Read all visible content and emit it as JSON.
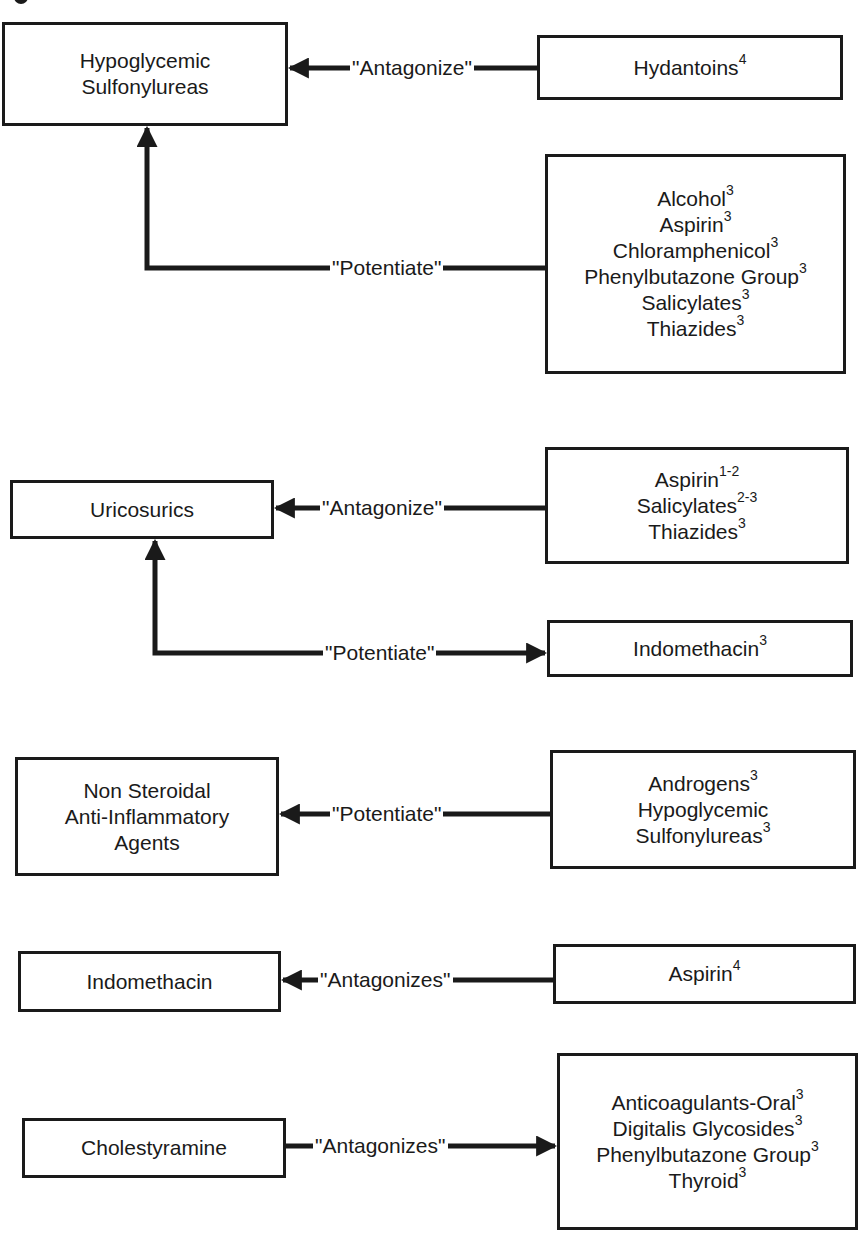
{
  "diagram": {
    "groups": [
      {
        "id": "sulfonylureas",
        "target": {
          "lines": [
            "Hypoglycemic",
            "Sulfonylureas"
          ]
        },
        "relations": [
          {
            "label": "\"Antagonize\"",
            "direction": "source-to-target",
            "sources": [
              {
                "name": "Hydantoins",
                "ref": "4"
              }
            ]
          },
          {
            "label": "\"Potentiate\"",
            "direction": "source-to-target",
            "sources": [
              {
                "name": "Alcohol",
                "ref": "3"
              },
              {
                "name": "Aspirin",
                "ref": "3"
              },
              {
                "name": "Chloramphenicol",
                "ref": "3"
              },
              {
                "name": "Phenylbutazone Group",
                "ref": "3"
              },
              {
                "name": "Salicylates",
                "ref": "3"
              },
              {
                "name": "Thiazides",
                "ref": "3"
              }
            ]
          }
        ]
      },
      {
        "id": "uricosurics",
        "target": {
          "lines": [
            "Uricosurics"
          ]
        },
        "relations": [
          {
            "label": "\"Antagonize\"",
            "direction": "source-to-target",
            "sources": [
              {
                "name": "Aspirin",
                "ref": "1-2"
              },
              {
                "name": "Salicylates",
                "ref": "2-3"
              },
              {
                "name": "Thiazides",
                "ref": "3"
              }
            ]
          },
          {
            "label": "\"Potentiate\"",
            "direction": "target-to-source",
            "sources": [
              {
                "name": "Indomethacin",
                "ref": "3"
              }
            ]
          }
        ]
      },
      {
        "id": "nsaids",
        "target": {
          "lines": [
            "Non Steroidal",
            "Anti-Inflammatory",
            "Agents"
          ]
        },
        "relations": [
          {
            "label": "\"Potentiate\"",
            "direction": "source-to-target",
            "sources": [
              {
                "name": "Androgens",
                "ref": "3"
              },
              {
                "name": "Hypoglycemic",
                "ref": ""
              },
              {
                "name": "Sulfonylureas",
                "ref": "3"
              }
            ]
          }
        ]
      },
      {
        "id": "indomethacin",
        "target": {
          "lines": [
            "Indomethacin"
          ]
        },
        "relations": [
          {
            "label": "\"Antagonizes\"",
            "direction": "source-to-target",
            "sources": [
              {
                "name": "Aspirin",
                "ref": "4"
              }
            ]
          }
        ]
      },
      {
        "id": "cholestyramine",
        "target": {
          "lines": [
            "Cholestyramine"
          ]
        },
        "relations": [
          {
            "label": "\"Antagonizes\"",
            "direction": "target-to-source",
            "sources": [
              {
                "name": "Anticoagulants-Oral",
                "ref": "3"
              },
              {
                "name": "Digitalis Glycosides",
                "ref": "3"
              },
              {
                "name": "Phenylbutazone Group",
                "ref": "3"
              },
              {
                "name": "Thyroid",
                "ref": "3"
              }
            ]
          }
        ]
      }
    ]
  },
  "colors": {
    "ink": "#1a1a1a",
    "background": "#ffffff"
  }
}
